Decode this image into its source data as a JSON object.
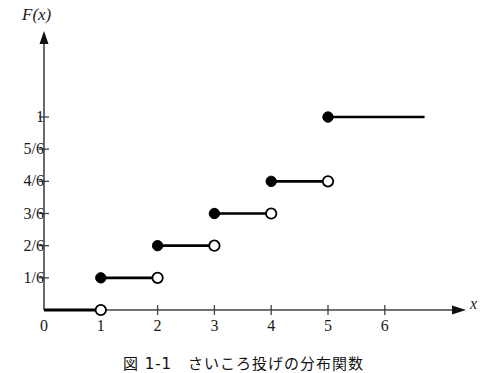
{
  "figure": {
    "caption": "図 1-1　さいころ投げの分布関数",
    "x_axis_title": "x",
    "y_axis_title": "F(x)",
    "line_color": "#000000",
    "axis_color": "#444444",
    "background": "#ffffff"
  },
  "chart_data": {
    "type": "line",
    "title": "F(x)",
    "subtitle": "",
    "xlabel": "x",
    "ylabel": "F(x)",
    "xlim": [
      0,
      6.8
    ],
    "ylim": [
      0,
      1.28
    ],
    "grid": false,
    "legend": "none",
    "x_ticks": [
      "0",
      "1",
      "2",
      "3",
      "4",
      "5",
      "6"
    ],
    "x_tick_values": [
      0,
      1,
      2,
      3,
      4,
      5,
      6
    ],
    "y_ticks": [
      "1/6",
      "2/6",
      "3/6",
      "4/6",
      "5/6",
      "1"
    ],
    "y_tick_values": [
      0.16667,
      0.33333,
      0.5,
      0.66667,
      0.83333,
      1
    ],
    "annotations": [],
    "series": [
      {
        "name": "F(x)",
        "kind": "step-cdf",
        "steps": [
          {
            "label": "F=0",
            "y": 0,
            "y_text": "0",
            "x_start": 0,
            "x_end": 1,
            "left_marker": "none",
            "right_marker": "open"
          },
          {
            "label": "F=1/6",
            "y": 0.16667,
            "y_text": "1/6",
            "x_start": 1,
            "x_end": 2,
            "left_marker": "filled",
            "right_marker": "open"
          },
          {
            "label": "F=2/6",
            "y": 0.33333,
            "y_text": "2/6",
            "x_start": 2,
            "x_end": 3,
            "left_marker": "filled",
            "right_marker": "open"
          },
          {
            "label": "F=3/6",
            "y": 0.5,
            "y_text": "3/6",
            "x_start": 3,
            "x_end": 4,
            "left_marker": "filled",
            "right_marker": "open"
          },
          {
            "label": "F=4/6",
            "y": 0.66667,
            "y_text": "4/6",
            "x_start": 4,
            "x_end": 5,
            "left_marker": "filled",
            "right_marker": "open"
          },
          {
            "label": "F=1",
            "y": 1,
            "y_text": "1",
            "x_start": 5,
            "x_end": 6.7,
            "left_marker": "filled",
            "right_marker": "none"
          }
        ]
      }
    ]
  }
}
